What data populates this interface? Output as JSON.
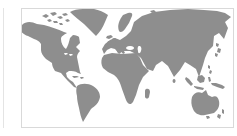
{
  "colors": {
    "background": "#ffffff",
    "card-background": "#ffffff",
    "card-border": "#d9d9d9",
    "adjacent-border": "#e4e4e4",
    "land": "#8e8e8e",
    "water": "#ffffff"
  },
  "map": {
    "viewbox": "0 0 211 118",
    "regions": [
      {
        "name": "north-america",
        "path": "M-1,17 C3,12 9,12 15,15 L22,16 C29,18 36,20 42,23 L45,24 C42,26 39,27 39,30 C39,34 41,38 44,40 C46,37 47,33 48,29 L51,26 C54,26 56,27 57,28 L58,34 L54,38 L58,42 C56,44 55,46 55,48 C56,53 57,58 58,63 L59,65 L56,64 C53,62 50,62 47,62 L44,64 L45,68 L48,71 L51,73 L55,79 L52,78 C48,74 43,69 39,64 L33,62 C31,59 30,56 30,54 L24,50 C21,47 19,44 19,41 L19,35 C17,32 15,31 12,30 L6,27 C3,26 0,24 -1,22 Z"
      },
      {
        "name": "arctic-islands",
        "path": "M20,7 l4,-2 3,2 -3,2 z M28,4 l5,-1 2,2 -4,2 z M35,8 l4,-1 2,2 -3,1 z M25,11 l3,-1 2,2 -3,1 z M31,12 l4,0 1,2 -4,0 z M40,5 l4,-1 2,2 -4,1 z M43,11 l3,-1 2,2 -3,1 z M37,14 l3,0 1,2 -3,0 z"
      },
      {
        "name": "greenland",
        "path": "M48,3 C51,1 56,0 61,0 L72,0 C77,1 82,3 86,6 L83,13 C81,18 78,23 74,27 C70,23 66,19 62,15 C57,11 52,7 48,3 Z"
      },
      {
        "name": "south-america",
        "path": "M55,77 C59,74 66,74 71,77 C76,80 78,84 78,88 C77,94 73,97 69,100 L64,108 L61,113 C59,109 58,104 57,99 C56,95 55,91 55,87 C54,83 54,80 55,77 Z"
      },
      {
        "name": "africa",
        "path": "M82,46 L90,44 L101,45 L114,44 L118,49 L121,56 L127,62 L121,68 L117,76 L114,86 L111,93 C109,96 106,96 104,91 L100,80 C98,73 96,69 92,66 L86,63 L81,59 C79,56 79,52 80,49 Z"
      },
      {
        "name": "madagascar",
        "path": "M124,80 C126,79 128,80 128,83 L127,88 C126,90 124,90 123,88 L123,83 C123,81 123,81 124,80 Z"
      },
      {
        "name": "eurasia",
        "path": "M82,45 L80,40 L83,35 L88,31 L93,29 L98,31 L104,27 L109,22 L112,13 L120,7 L132,3 L148,1 L166,0 L182,1 L195,2 L203,4 L209,8 L203,13 L206,19 L202,30 L197,24 L192,27 L191,37 L186,42 L183,49 L181,56 L177,68 L174,60 L168,56 L163,53 L158,61 L152,68 L146,57 L140,52 L134,56 L131,62 L125,60 L119,49 L114,45 L108,42 L101,42 L97,45 L93,40 L89,39 L85,41 Z"
      },
      {
        "name": "scandinavia",
        "path": "M97,22 C95,17 97,11 101,6 L106,4 C109,3 111,4 110,7 L107,14 L103,20 C101,23 98,24 97,22 Z"
      },
      {
        "name": "great-britain",
        "path": "M90,30 C92,28 94,29 94,31 L93,36 C92,38 90,38 89,36 Z"
      },
      {
        "name": "ireland",
        "path": "M86,32 l3,1 -1,3 -3,-1 z"
      },
      {
        "name": "iceland",
        "path": "M85,27 l4,-1 2,2 -4,2 -3,-1 z"
      },
      {
        "name": "italy",
        "path": "M98,38 L101,40 L103,44 L101,45 L98,41 Z"
      },
      {
        "name": "mediterranean-islands",
        "path": "M100,46 l2,-1 1,2 -2,1 z M95,42 l2,-1 1,2 -2,1 z"
      },
      {
        "name": "japan",
        "path": "M194,34 l3,1 -1,3 -2,-1 z M196,39 l3,1 -1,4 -3,-1 z M193,44 l3,1 -1,3 -2,-1 z"
      },
      {
        "name": "philippines",
        "path": "M186,56 l2,1 0,3 -2,-1 z M188,61 l2,1 -1,3 -2,-1 z"
      },
      {
        "name": "sumatra",
        "path": "M164,68 l3,2 4,5 -2,2 -4,-4 -2,-3 z"
      },
      {
        "name": "java",
        "path": "M172,77 l6,1 4,1 -1,2 -6,-1 -3,-2 z"
      },
      {
        "name": "borneo",
        "path": "M176,67 l4,-1 3,3 -1,4 -4,1 -3,-3 z"
      },
      {
        "name": "sulawesi",
        "path": "M186,68 l2,0 1,4 -2,1 z"
      },
      {
        "name": "new-guinea",
        "path": "M189,74 l5,0 6,2 3,2 -2,2 -6,-2 -5,-2 z"
      },
      {
        "name": "australia",
        "path": "M170,88 C172,84 176,82 180,84 L184,81 L186,86 L190,88 C194,86 196,88 197,92 C198,97 196,101 192,104 L183,106 C178,107 173,105 171,100 C169,96 169,92 170,88 Z"
      },
      {
        "name": "tasmania",
        "path": "M184,107 l3,0 1,2 -3,1 z"
      },
      {
        "name": "new-zealand",
        "path": "M200,100 l2,1 0,4 -2,-1 z M196,105 l3,1 -1,4 -3,-2 z"
      },
      {
        "name": "caribbean-islands",
        "path": "M50,67 l5,0 2,1 -5,1 z M58,68 l3,0 1,1 -3,1 z"
      },
      {
        "name": "sri-lanka",
        "path": "M152,70 a1.5,2 0 1,0 0.1,0 z"
      },
      {
        "name": "arctic-russia-islands",
        "path": "M128,2 l4,-1 2,2 -4,1 z M138,3 l5,0 2,2 -5,1 z"
      }
    ],
    "water_bodies": [
      {
        "name": "black-sea",
        "path": "M108,37 a4,2 0 1,0 0.1,0 z"
      },
      {
        "name": "caspian-sea",
        "path": "M117,37 c2,0 3,2 2,5 c-1,3 -3,3 -3,0 c-1,-3 0,-5 1,-5 z"
      },
      {
        "name": "great-lakes",
        "path": "M42,44 l3,0 1,1 -3,1 z M47,45 l3,0 1,1 -3,1 z"
      }
    ]
  }
}
